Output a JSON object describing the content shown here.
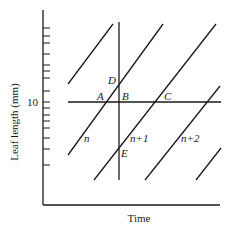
{
  "diagram": {
    "ylabel": "Leaf length (mm)",
    "xlabel": "Time",
    "ytick_label": "10",
    "points": {
      "A": "A",
      "B": "B",
      "C": "C",
      "D": "D",
      "E": "E"
    },
    "leaf_labels": {
      "n": "n",
      "n1": "n+1",
      "n2": "n+2"
    },
    "colors": {
      "line": "#1a1a1a",
      "background": "#ffffff"
    }
  }
}
